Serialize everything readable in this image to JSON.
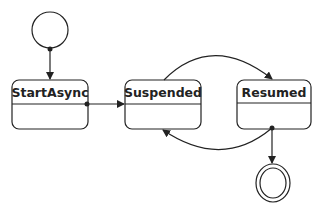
{
  "diagram": {
    "type": "state-machine",
    "colors": {
      "stroke": "#222222",
      "fill": "#ffffff",
      "text": "#222222"
    },
    "initial_state": {
      "name": "initial"
    },
    "states": [
      {
        "id": "startasync",
        "label": "StartAsync"
      },
      {
        "id": "suspended",
        "label": "Suspended"
      },
      {
        "id": "resumed",
        "label": "Resumed"
      }
    ],
    "final_state": {
      "name": "final"
    },
    "transitions": [
      {
        "from": "initial",
        "to": "StartAsync"
      },
      {
        "from": "StartAsync",
        "to": "Suspended"
      },
      {
        "from": "Suspended",
        "to": "Resumed"
      },
      {
        "from": "Resumed",
        "to": "Suspended"
      },
      {
        "from": "Resumed",
        "to": "final"
      }
    ]
  }
}
